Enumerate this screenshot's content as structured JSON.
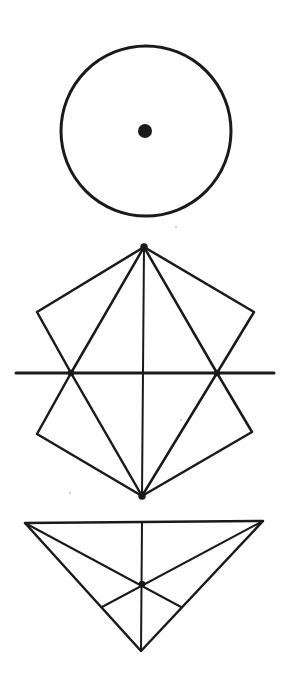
{
  "diagram": {
    "background": "#ffffff",
    "ink_color": "#1a1a1a",
    "figures": [
      {
        "name": "circle-with-center",
        "circle": {
          "cx": 146,
          "cy": 131,
          "r": 85
        },
        "center_dot": {
          "cx": 145,
          "cy": 131,
          "r": 7
        }
      },
      {
        "name": "kite-hexagon-construction",
        "top_vertex": [
          144,
          247
        ],
        "bottom_vertex": [
          142,
          496
        ],
        "upper_left": [
          37,
          312
        ],
        "upper_right": [
          254,
          312
        ],
        "lower_left": [
          37,
          434
        ],
        "lower_right": [
          252,
          432
        ],
        "horizontal_axis": {
          "x1": 16,
          "x2": 274,
          "y": 373
        },
        "axis_intersections": [
          [
            71,
            373
          ],
          [
            217,
            373
          ]
        ]
      },
      {
        "name": "triangle-with-medians",
        "vertices": [
          [
            25,
            523
          ],
          [
            263,
            521
          ],
          [
            141,
            651
          ]
        ],
        "centroid": [
          142,
          584
        ],
        "altitude_top": [
          142,
          522
        ],
        "median_feet": [
          [
            102,
            607
          ],
          [
            181,
            607
          ]
        ]
      }
    ]
  }
}
